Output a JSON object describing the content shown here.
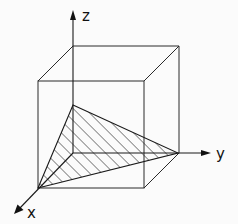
{
  "diagram": {
    "axes": {
      "x": {
        "label": "x"
      },
      "y": {
        "label": "y"
      },
      "z": {
        "label": "z"
      }
    },
    "cube": {
      "edges": 12
    },
    "plane": {
      "shape": "triangle",
      "fill": "diagonal-hatch",
      "vertices": [
        "x-intercept",
        "y-intercept",
        "z-intercept"
      ]
    },
    "colors": {
      "line": "#1a1a1a",
      "background": "#fbfbfb"
    }
  }
}
